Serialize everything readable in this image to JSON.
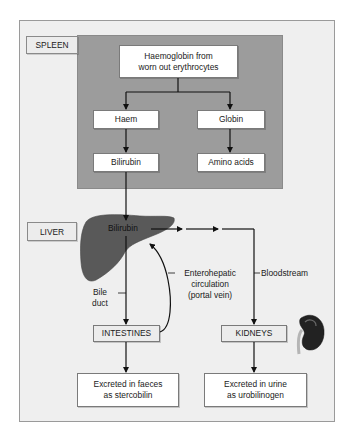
{
  "diagram": {
    "spleen": {
      "label": "SPLEEN",
      "source": "Haemoglobin from worn out erythrocytes",
      "source_lines": [
        "Haemoglobin from",
        "worn out erythrocytes"
      ],
      "haem": "Haem",
      "globin": "Globin",
      "bilirubin": "Bilirubin",
      "amino_acids": "Amino acids"
    },
    "liver": {
      "label": "LIVER",
      "bilirubin": "Bilirubin"
    },
    "pathways": {
      "bile_duct_lines": [
        "Bile",
        "duct"
      ],
      "enterohepatic_lines": [
        "Enterohepatic",
        "circulation",
        "(portal vein)"
      ],
      "bloodstream": "Bloodstream"
    },
    "intestines": {
      "label": "INTESTINES",
      "excretion_lines": [
        "Excreted in faeces",
        "as stercobilin"
      ]
    },
    "kidneys": {
      "label": "KIDNEYS",
      "excretion_lines": [
        "Excreted in urine",
        "as urobilinogen"
      ]
    },
    "icons": [
      "liver-icon",
      "kidney-icon"
    ],
    "colors": {
      "panel_bg": "#efefef",
      "spleen_bg": "#9c9c9c",
      "liver_fill": "#555555",
      "kidney_fill": "#2a2a2a",
      "box_bg": "#ffffff",
      "arrow": "#111111"
    }
  }
}
